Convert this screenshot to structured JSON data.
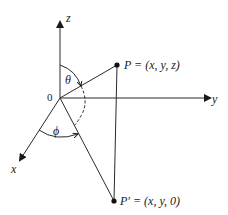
{
  "diagram": {
    "type": "spherical-coordinates",
    "axes": {
      "z": {
        "label": "z"
      },
      "y": {
        "label": "y"
      },
      "x": {
        "label": "x"
      }
    },
    "origin": {
      "label": "0"
    },
    "points": {
      "P": {
        "label": "P = (x, y, z)"
      },
      "P_prime": {
        "label": "P′ = (x, y, 0)"
      }
    },
    "angles": {
      "theta": {
        "label": "θ",
        "description": "angle from z axis to OP"
      },
      "phi": {
        "label": "ϕ",
        "description": "angle from x axis to OP′"
      }
    },
    "colors": {
      "line": "#2a2a2a",
      "background": "#ffffff"
    }
  }
}
